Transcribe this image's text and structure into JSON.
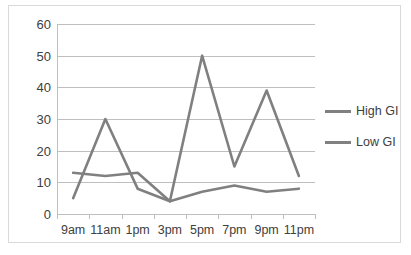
{
  "chart_data": {
    "type": "line",
    "title": "",
    "xlabel": "",
    "ylabel": "",
    "categories": [
      "9am",
      "11am",
      "1pm",
      "3pm",
      "5pm",
      "7pm",
      "9pm",
      "11pm"
    ],
    "series": [
      {
        "name": "High GI",
        "color": "#808080",
        "values": [
          5,
          30,
          8,
          4,
          50,
          15,
          39,
          12
        ]
      },
      {
        "name": "Low GI",
        "color": "#808080",
        "values": [
          13,
          12,
          13,
          4,
          7,
          9,
          7,
          8
        ]
      }
    ],
    "ylim": [
      0,
      60
    ],
    "yticks": [
      0,
      10,
      20,
      30,
      40,
      50,
      60
    ],
    "ytick_labels": [
      "0",
      "10",
      "20",
      "30",
      "40",
      "50",
      "60"
    ],
    "grid": "horizontal",
    "legend_position": "right",
    "line_color": "#808080",
    "grid_color": "#bfbfbf",
    "border_color": "#d9d9d9",
    "background": "#ffffff"
  }
}
